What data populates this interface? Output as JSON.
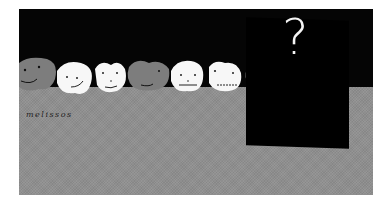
{
  "scene": {
    "caption": "melissos",
    "panel_symbol": "?",
    "colors": {
      "sky": "#050505",
      "floor": "#8f8f8f",
      "gray_face": "#7d7d7d",
      "white_face": "#f7f7f7",
      "panel": "#000000",
      "symbol": "#f4f4f4"
    },
    "faces": [
      {
        "tone": "gray"
      },
      {
        "tone": "white"
      },
      {
        "tone": "white"
      },
      {
        "tone": "gray"
      },
      {
        "tone": "white"
      },
      {
        "tone": "white"
      },
      {
        "tone": "gray"
      }
    ]
  }
}
